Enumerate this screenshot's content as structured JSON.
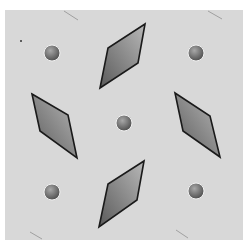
{
  "figure": {
    "panel": {
      "x": 5,
      "y": 10,
      "width": 238,
      "height": 230,
      "fill": "#d8d8d8"
    },
    "colors": {
      "shape_dark": "#5a5a5a",
      "shape_light": "#b8b8b8",
      "outline": "#1a1a1a",
      "sphere_dark": "#4a4a4a",
      "sphere_light": "#a8a8a8"
    },
    "spheres": [
      {
        "name": "top-left",
        "cx": 52,
        "cy": 53,
        "r": 8
      },
      {
        "name": "top-right",
        "cx": 196,
        "cy": 53,
        "r": 8
      },
      {
        "name": "center",
        "cx": 124,
        "cy": 123,
        "r": 8
      },
      {
        "name": "bottom-left",
        "cx": 52,
        "cy": 192,
        "r": 8
      },
      {
        "name": "bottom-right",
        "cx": 196,
        "cy": 191,
        "r": 8
      }
    ],
    "parallelograms": [
      {
        "name": "top",
        "points": "145,24 138,63 100,88 108,48"
      },
      {
        "name": "left",
        "points": "32,94 68,115 77,158 40,131"
      },
      {
        "name": "right",
        "points": "175,93 210,116 220,157 183,131"
      },
      {
        "name": "bottom",
        "points": "144,161 137,200 99,227 108,184"
      }
    ],
    "streaks": [
      {
        "x1": 64,
        "y1": 11,
        "x2": 78,
        "y2": 20
      },
      {
        "x1": 208,
        "y1": 11,
        "x2": 222,
        "y2": 19
      },
      {
        "x1": 30,
        "y1": 232,
        "x2": 42,
        "y2": 239
      },
      {
        "x1": 176,
        "y1": 230,
        "x2": 188,
        "y2": 238
      }
    ]
  }
}
